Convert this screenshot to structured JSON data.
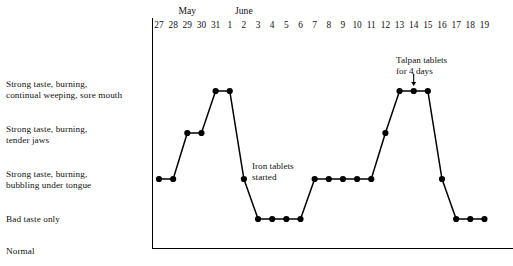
{
  "chart_data": {
    "type": "line",
    "title": "",
    "subtitle": "",
    "xlabel": "",
    "ylabel": "",
    "grid": false,
    "legend": null,
    "x_axis": {
      "tick_labels": [
        "27",
        "28",
        "29",
        "30",
        "31",
        "1",
        "2",
        "3",
        "4",
        "5",
        "6",
        "7",
        "8",
        "9",
        "10",
        "11",
        "12",
        "13",
        "14",
        "15",
        "16",
        "17",
        "18",
        "19"
      ],
      "month_groups": [
        {
          "label": "May",
          "start_tick": "27",
          "end_tick": "31",
          "center_index": 2
        },
        {
          "label": "June",
          "start_tick": "1",
          "end_tick": "19",
          "center_index": 6
        }
      ]
    },
    "y_axis": {
      "ylim": [
        0,
        5
      ],
      "category_levels": [
        {
          "level": 5,
          "label": "Strong taste, burning,\ncontinual weeping, sore mouth"
        },
        {
          "level": 4,
          "label": "Strong taste, burning,\ntender jaws"
        },
        {
          "level": 3,
          "label": "Strong taste, burning,\nbubbling under tongue"
        },
        {
          "level": 2,
          "label": "Bad taste only"
        },
        {
          "level": 1,
          "label": "Normal"
        }
      ]
    },
    "categories": [
      "27",
      "28",
      "29",
      "30",
      "31",
      "1",
      "2",
      "3",
      "4",
      "5",
      "6",
      "7",
      "8",
      "9",
      "10",
      "11",
      "12",
      "13",
      "14",
      "15",
      "16",
      "17",
      "18",
      "19"
    ],
    "values": [
      3,
      3,
      4,
      4,
      5,
      5,
      3,
      2,
      2,
      2,
      2,
      3,
      3,
      3,
      3,
      3,
      4,
      5,
      5,
      5,
      3,
      2,
      2,
      2
    ],
    "series": [
      {
        "name": "symptom severity",
        "values": [
          3,
          3,
          4,
          4,
          5,
          5,
          3,
          2,
          2,
          2,
          2,
          3,
          3,
          3,
          3,
          3,
          4,
          5,
          5,
          5,
          3,
          2,
          2,
          2
        ]
      }
    ],
    "annotations": [
      {
        "id": "iron-tablets",
        "text": "Iron tablets\nstarted",
        "target_tick": "2",
        "target_level": 3,
        "arrow": false
      },
      {
        "id": "talpan-tablets",
        "text": "Talpan tablets\nfor 4 days",
        "target_tick": "14",
        "target_level": 5,
        "arrow": true
      }
    ],
    "marker": "filled-circle",
    "line_color": "#000000",
    "marker_color": "#000000",
    "background_color": "#ffffff"
  }
}
